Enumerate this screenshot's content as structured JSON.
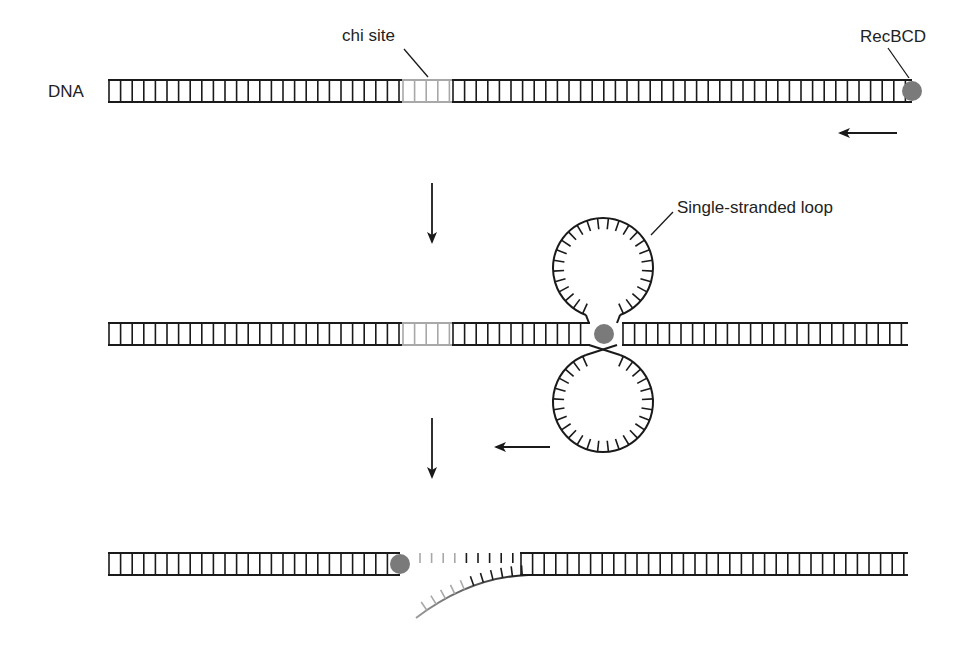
{
  "labels": {
    "dna": "DNA",
    "chi_site": "chi site",
    "recbcd": "RecBCD",
    "single_stranded_loop": "Single-stranded loop"
  },
  "colors": {
    "strand": "#1a1a1a",
    "chi_site": "#a8a8a8",
    "recbcd": "#7a7a7a",
    "background": "#ffffff"
  },
  "icons": {
    "recbcd": "gray-circle",
    "direction_arrow": "left-arrow",
    "step_arrow": "down-arrow"
  },
  "panels": [
    {
      "id": "step-1",
      "description": "RecBCD binds DNA end and moves leftward toward chi site",
      "strand_y": [
        80,
        102
      ],
      "segments": [
        {
          "x1": 108,
          "x2": 402,
          "style": "normal"
        },
        {
          "x1": 402,
          "x2": 452,
          "style": "chi"
        },
        {
          "x1": 452,
          "x2": 912,
          "style": "normal"
        }
      ],
      "recbcd": {
        "cx": 912,
        "cy": 91,
        "r": 10
      },
      "arrow": {
        "x1": 897,
        "x2": 840,
        "y": 133
      }
    },
    {
      "id": "step-2",
      "description": "RecBCD unwinds DNA forming single-stranded loops",
      "strand_y": [
        323,
        345
      ],
      "segments": [
        {
          "x1": 108,
          "x2": 402,
          "style": "normal"
        },
        {
          "x1": 402,
          "x2": 452,
          "style": "chi"
        },
        {
          "x1": 452,
          "x2": 590,
          "style": "normal"
        },
        {
          "x1": 622,
          "x2": 908,
          "style": "normal"
        }
      ],
      "recbcd": {
        "cx": 604,
        "cy": 334,
        "r": 10
      },
      "loops": [
        {
          "cx": 603,
          "cy": 268,
          "r": 50,
          "opening": "bottom"
        },
        {
          "cx": 603,
          "cy": 402,
          "r": 50,
          "opening": "top"
        }
      ],
      "arrow": {
        "x1": 550,
        "x2": 496,
        "y": 447
      }
    },
    {
      "id": "step-3",
      "description": "At chi site, RecBCD nicks DNA producing a single-stranded tail",
      "strand_y": [
        553,
        575
      ],
      "segments": [
        {
          "x1": 108,
          "x2": 400,
          "style": "normal"
        },
        {
          "x1": 520,
          "x2": 908,
          "style": "normal"
        }
      ],
      "recbcd": {
        "cx": 400,
        "cy": 564,
        "r": 10
      }
    }
  ],
  "step_arrows": [
    {
      "x": 432,
      "y1": 183,
      "y2": 242
    },
    {
      "x": 432,
      "y1": 418,
      "y2": 477
    }
  ]
}
